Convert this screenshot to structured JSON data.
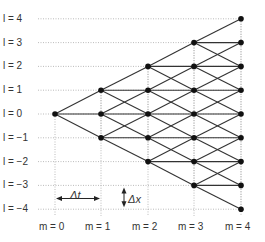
{
  "diagram": {
    "type": "trinomial-lattice",
    "row_labels": [
      "l = 4",
      "l = 3",
      "l = 2",
      "l = 1",
      "l = 0",
      "l = −1",
      "l = −2",
      "l = −3",
      "l = −4"
    ],
    "row_values": [
      4,
      3,
      2,
      1,
      0,
      -1,
      -2,
      -3,
      -4
    ],
    "col_labels": [
      "m = 0",
      "m = 1",
      "m = 2",
      "m = 3",
      "m = 4"
    ],
    "col_values": [
      0,
      1,
      2,
      3,
      4
    ],
    "dt_label": "Δt",
    "dx_label": "Δx",
    "colors": {
      "line": "#333333",
      "node": "#111111",
      "grid": "#aaaaaa",
      "text": "#333333"
    }
  }
}
